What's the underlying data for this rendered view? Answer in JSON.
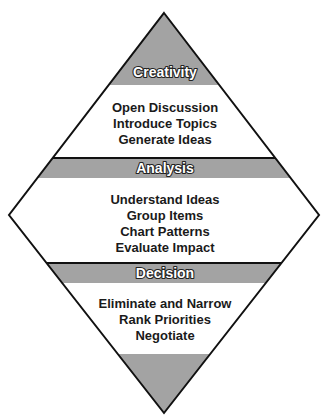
{
  "diagram": {
    "shape": "diamond",
    "colors": {
      "band_fill": "#a3a3a3",
      "background_fill": "#ffffff",
      "outline": "#111111",
      "header_text": "#ffffff",
      "body_text": "#1a1a1a"
    },
    "stages": [
      {
        "title": "Creativity",
        "items": [
          "Open Discussion",
          "Introduce Topics",
          "Generate Ideas"
        ]
      },
      {
        "title": "Analysis",
        "items": [
          "Understand Ideas",
          "Group Items",
          "Chart Patterns",
          "Evaluate Impact"
        ]
      },
      {
        "title": "Decision",
        "items": [
          "Eliminate and Narrow",
          "Rank Priorities",
          "Negotiate"
        ]
      }
    ]
  }
}
